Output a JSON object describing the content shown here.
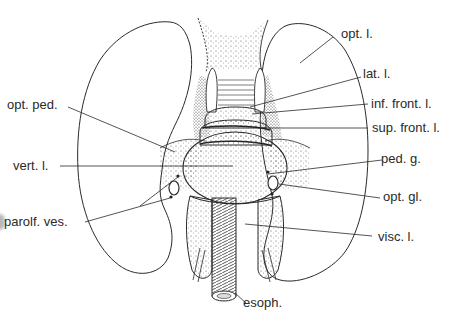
{
  "figure": {
    "labels": {
      "opt_l": "opt. l.",
      "lat_l": "lat. l.",
      "inf_front_l": "inf. front. l.",
      "sup_front_l": "sup. front. l.",
      "ped_g": "ped. g.",
      "opt_gl": "opt. gl.",
      "visc_l": "visc. l.",
      "esoph": "esoph.",
      "opt_ped": "opt. ped.",
      "vert_l": "vert. l.",
      "parolf_ves": "parolf. ves."
    },
    "colors": {
      "ink": "#2a2a2a",
      "background": "#ffffff",
      "stipple": "#555555"
    }
  }
}
